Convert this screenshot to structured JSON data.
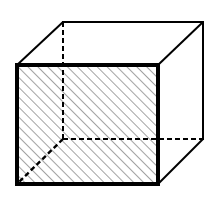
{
  "diagram": {
    "type": "cube-wireframe",
    "colors": {
      "stroke": "#000000",
      "background": "#ffffff",
      "hatch": "#555555"
    },
    "front_face": {
      "x": 17,
      "y": 65,
      "width": 141,
      "height": 119,
      "fill": "diagonal-hatch"
    },
    "back_face": {
      "x": 63,
      "y": 22,
      "width": 140,
      "height": 117
    },
    "visible_edges": [
      {
        "name": "top-left-connector",
        "x1": 17,
        "y1": 65,
        "x2": 63,
        "y2": 22
      },
      {
        "name": "top-back-edge",
        "x1": 63,
        "y1": 22,
        "x2": 203,
        "y2": 22
      },
      {
        "name": "top-right-connector",
        "x1": 158,
        "y1": 65,
        "x2": 203,
        "y2": 22
      },
      {
        "name": "right-back-edge",
        "x1": 203,
        "y1": 22,
        "x2": 203,
        "y2": 139
      },
      {
        "name": "bottom-right-connector",
        "x1": 158,
        "y1": 184,
        "x2": 203,
        "y2": 139
      }
    ],
    "hidden_edges": [
      {
        "name": "back-left-vertical",
        "x1": 63,
        "y1": 22,
        "x2": 63,
        "y2": 139
      },
      {
        "name": "back-bottom-horizontal",
        "x1": 63,
        "y1": 139,
        "x2": 203,
        "y2": 139
      },
      {
        "name": "bottom-left-connector",
        "x1": 63,
        "y1": 139,
        "x2": 17,
        "y2": 184
      }
    ]
  }
}
